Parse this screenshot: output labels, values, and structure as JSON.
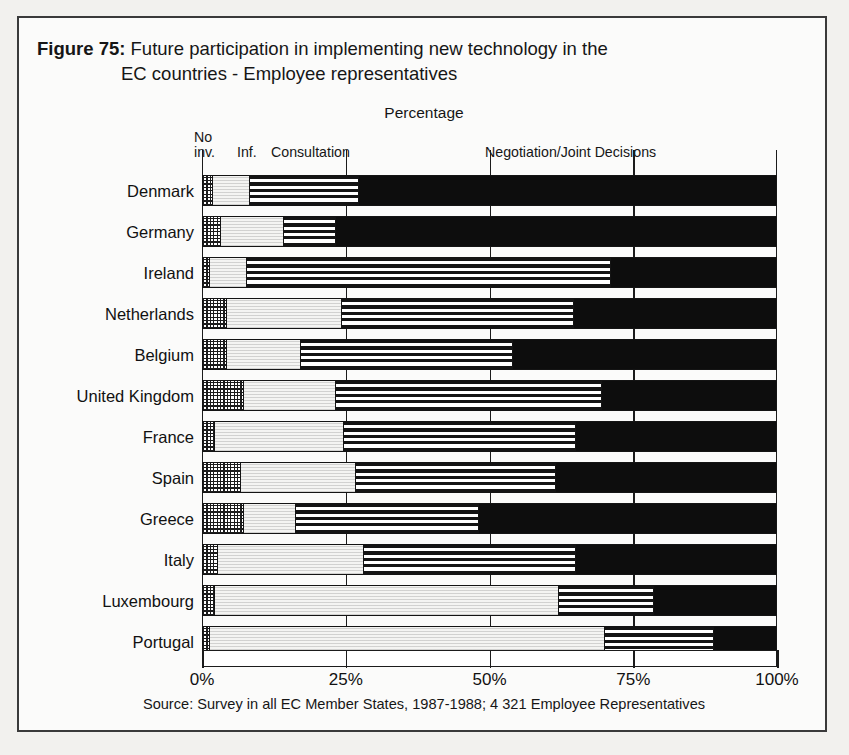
{
  "figure": {
    "label": "Figure 75:",
    "title_line_1": "Future participation in implementing new technology in the",
    "title_line_2": "EC countries - Employee representatives",
    "percentage_caption": "Percentage",
    "source": "Source: Survey in all EC Member States, 1987-1988; 4 321 Employee Representatives"
  },
  "legend": {
    "no_inv_line1": "No",
    "no_inv_line2": "inv.",
    "inf": "Inf.",
    "consultation": "Consultation",
    "negotiation": "Negotiation/Joint Decisions"
  },
  "axis": {
    "ticks": [
      "0%",
      "25%",
      "50%",
      "75%",
      "100%"
    ],
    "tick_values": [
      0,
      25,
      50,
      75,
      100
    ]
  },
  "chart_data": {
    "type": "bar",
    "orientation": "horizontal",
    "stacked": true,
    "normalized_percent": true,
    "title": "Figure 75: Future participation in implementing new technology in the EC countries - Employee representatives",
    "subtitle": "Percentage",
    "xlabel": "Percentage",
    "ylabel": "",
    "xlim": [
      0,
      100
    ],
    "xticks": [
      0,
      25,
      50,
      75,
      100
    ],
    "xticklabels": [
      "0%",
      "25%",
      "50%",
      "75%",
      "100%"
    ],
    "grid": true,
    "legend_position": "top",
    "categories": [
      "Denmark",
      "Germany",
      "Ireland",
      "Netherlands",
      "Belgium",
      "United Kingdom",
      "France",
      "Spain",
      "Greece",
      "Italy",
      "Luxembourg",
      "Portugal"
    ],
    "series": [
      {
        "name": "No inv.",
        "pattern": "checkerboard",
        "values": [
          1.5,
          3.0,
          1.0,
          4.0,
          4.0,
          7.0,
          2.0,
          6.5,
          7.0,
          2.5,
          2.0,
          1.0
        ]
      },
      {
        "name": "Inf.",
        "pattern": "light-stipple",
        "values": [
          6.5,
          11.0,
          6.5,
          20.0,
          13.0,
          16.0,
          22.5,
          20.0,
          9.0,
          25.5,
          60.0,
          69.0
        ]
      },
      {
        "name": "Consultation",
        "pattern": "horizontal-stripes",
        "values": [
          19.0,
          9.0,
          63.5,
          40.5,
          37.0,
          46.5,
          40.5,
          35.0,
          32.0,
          37.0,
          16.5,
          19.0
        ]
      },
      {
        "name": "Negotiation/Joint Decisions",
        "pattern": "solid-black",
        "values": [
          73.0,
          77.0,
          29.0,
          35.5,
          46.0,
          30.5,
          35.0,
          38.5,
          52.0,
          35.0,
          21.5,
          11.0
        ]
      }
    ],
    "source": "Source: Survey in all EC Member States, 1987-1988; 4 321 Employee Representatives"
  }
}
